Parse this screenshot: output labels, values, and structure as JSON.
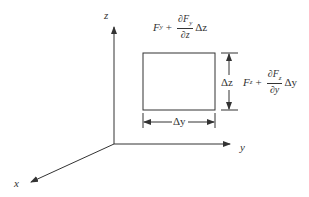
{
  "diagram": {
    "type": "3D force element diagram",
    "axes": {
      "x_label": "x",
      "y_label": "y",
      "z_label": "z"
    },
    "top_force": {
      "base": "F",
      "base_sub": "y",
      "plus": "+",
      "num": "∂F",
      "num_sub": "y",
      "den": "∂z",
      "tail": "Δz"
    },
    "side_force": {
      "base": "F",
      "base_sub": "z",
      "plus": "+",
      "num": "∂F",
      "num_sub": "z",
      "den": "∂y",
      "tail": "Δy"
    },
    "dimensions": {
      "width_label": "Δy",
      "height_label": "Δz"
    },
    "colors": {
      "line": "#333333",
      "background": "#ffffff"
    }
  }
}
